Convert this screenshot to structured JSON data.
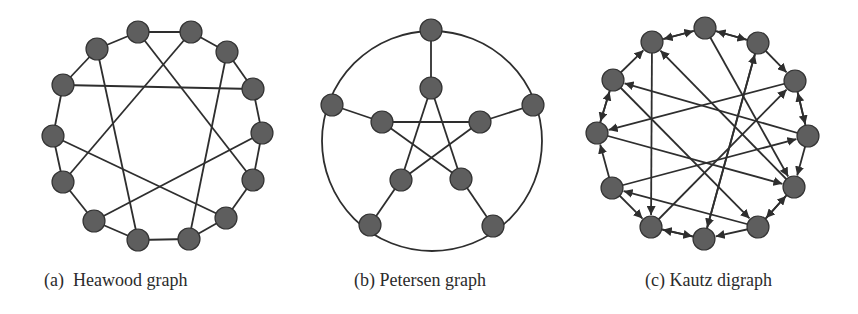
{
  "figure": {
    "panels": [
      {
        "id": "a",
        "label": "(a)",
        "title": "Heawood graph",
        "caption": "(a)  Heawood graph",
        "directed": false,
        "node_count": 14,
        "nodes": [
          [
            138,
            32
          ],
          [
            191,
            32
          ],
          [
            227,
            52
          ],
          [
            253,
            89
          ],
          [
            262,
            133
          ],
          [
            253,
            180
          ],
          [
            226,
            218
          ],
          [
            189,
            239
          ],
          [
            138,
            240
          ],
          [
            94,
            221
          ],
          [
            63,
            182
          ],
          [
            53,
            136
          ],
          [
            63,
            85
          ],
          [
            97,
            49
          ]
        ],
        "ring": true,
        "chords": [
          [
            0,
            5
          ],
          [
            2,
            7
          ],
          [
            4,
            9
          ],
          [
            6,
            11
          ],
          [
            8,
            13
          ],
          [
            10,
            1
          ],
          [
            12,
            3
          ]
        ]
      },
      {
        "id": "b",
        "label": "(b)",
        "title": "Petersen graph",
        "caption": "(b) Petersen graph",
        "directed": false,
        "node_count": 10,
        "outer_circle": {
          "cx": 432,
          "cy": 141,
          "r": 110
        },
        "outer_nodes": [
          [
            431,
            30
          ],
          [
            533,
            105
          ],
          [
            493,
            226
          ],
          [
            370,
            225
          ],
          [
            332,
            105
          ]
        ],
        "inner_nodes": [
          [
            431,
            88
          ],
          [
            480,
            122
          ],
          [
            461,
            179
          ],
          [
            401,
            180
          ],
          [
            382,
            122
          ]
        ],
        "spokes": [
          [
            0,
            0
          ],
          [
            1,
            1
          ],
          [
            2,
            2
          ],
          [
            3,
            3
          ],
          [
            4,
            4
          ]
        ],
        "pentagram": [
          [
            0,
            2
          ],
          [
            2,
            4
          ],
          [
            4,
            1
          ],
          [
            1,
            3
          ],
          [
            3,
            0
          ]
        ]
      },
      {
        "id": "c",
        "label": "(c)",
        "title": "Kautz digraph",
        "caption": "(c) Kautz digraph",
        "directed": true,
        "node_count": 12,
        "nodes": [
          [
            705,
            28
          ],
          [
            758,
            43
          ],
          [
            795,
            81
          ],
          [
            808,
            136
          ],
          [
            794,
            187
          ],
          [
            758,
            227
          ],
          [
            704,
            239
          ],
          [
            651,
            227
          ],
          [
            612,
            188
          ],
          [
            597,
            133
          ],
          [
            613,
            80
          ],
          [
            652,
            42
          ]
        ],
        "edges": [
          [
            0,
            1
          ],
          [
            0,
            4
          ],
          [
            1,
            2
          ],
          [
            1,
            6
          ],
          [
            2,
            3
          ],
          [
            2,
            9
          ],
          [
            3,
            4
          ],
          [
            3,
            10
          ],
          [
            4,
            5
          ],
          [
            4,
            11
          ],
          [
            5,
            4
          ],
          [
            5,
            8
          ],
          [
            6,
            7
          ],
          [
            6,
            1
          ],
          [
            7,
            6
          ],
          [
            7,
            2
          ],
          [
            8,
            9
          ],
          [
            8,
            3
          ],
          [
            9,
            10
          ],
          [
            9,
            4
          ],
          [
            10,
            11
          ],
          [
            10,
            5
          ],
          [
            11,
            0
          ],
          [
            11,
            7
          ],
          [
            0,
            11
          ],
          [
            10,
            9
          ],
          [
            8,
            7
          ],
          [
            3,
            2
          ],
          [
            5,
            6
          ],
          [
            1,
            0
          ]
        ]
      }
    ],
    "style": {
      "node_fill": "#5e5e5e",
      "node_stroke": "#333333",
      "edge_color": "#2e2e2e",
      "node_radius": 11
    }
  }
}
